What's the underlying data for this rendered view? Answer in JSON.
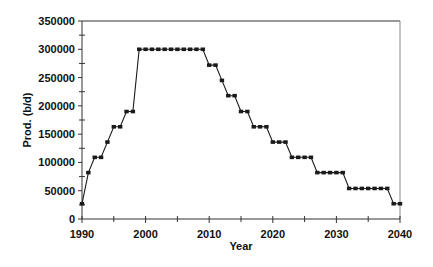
{
  "chart_data": {
    "type": "line",
    "title": "",
    "xlabel": "Year",
    "ylabel": "Prod. (b/d)",
    "xlim": [
      1990,
      2040
    ],
    "ylim": [
      0,
      350000
    ],
    "x_ticks": [
      1990,
      2000,
      2010,
      2020,
      2030,
      2040
    ],
    "x_minor_ticks": [
      1995,
      2005,
      2015,
      2025,
      2035
    ],
    "y_ticks": [
      0,
      50000,
      100000,
      150000,
      200000,
      250000,
      300000,
      350000
    ],
    "grid": false,
    "legend": null,
    "marker": "square",
    "line_color": "#1a1a1a",
    "series": [
      {
        "name": "Production",
        "x": [
          1990,
          1991,
          1992,
          1993,
          1994,
          1995,
          1996,
          1997,
          1998,
          1999,
          2000,
          2001,
          2002,
          2003,
          2004,
          2005,
          2006,
          2007,
          2008,
          2009,
          2010,
          2011,
          2012,
          2013,
          2014,
          2015,
          2016,
          2017,
          2018,
          2019,
          2020,
          2021,
          2022,
          2023,
          2024,
          2025,
          2026,
          2027,
          2028,
          2029,
          2030,
          2031,
          2032,
          2033,
          2034,
          2035,
          2036,
          2037,
          2038,
          2039,
          2040
        ],
        "values": [
          27000,
          82000,
          109000,
          109000,
          136000,
          163000,
          163000,
          190000,
          190000,
          300000,
          300000,
          300000,
          300000,
          300000,
          300000,
          300000,
          300000,
          300000,
          300000,
          300000,
          272000,
          272000,
          245000,
          218000,
          218000,
          190000,
          190000,
          163000,
          163000,
          163000,
          136000,
          136000,
          136000,
          109000,
          109000,
          109000,
          109000,
          82000,
          82000,
          82000,
          82000,
          82000,
          54000,
          54000,
          54000,
          54000,
          54000,
          54000,
          54000,
          27000,
          27000
        ]
      }
    ]
  },
  "labels": {
    "xlabel": "Year",
    "ylabel": "Prod. (b/d)",
    "x_tick_labels": [
      "1990",
      "2000",
      "2010",
      "2020",
      "2030",
      "2040"
    ],
    "y_tick_labels": [
      "0",
      "50000",
      "100000",
      "150000",
      "200000",
      "250000",
      "300000",
      "350000"
    ]
  }
}
